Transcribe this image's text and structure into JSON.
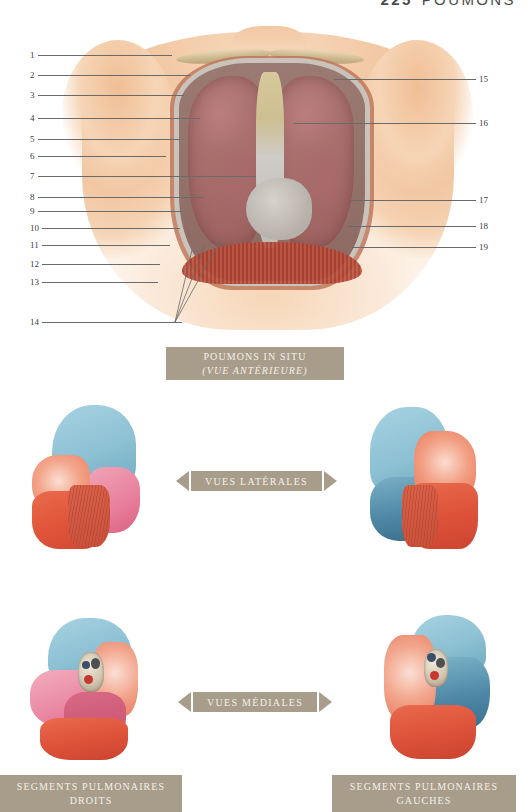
{
  "page": {
    "folio": "225",
    "running_head": "POUMONS",
    "background_color": "#ffffff",
    "plaque_color": "#a89d8a",
    "plaque_text_color": "#f4f0e8",
    "leader_color": "#6a6a6a"
  },
  "figure_anterior": {
    "caption_line1": "POUMONS IN SITU",
    "caption_line2": "(VUE ANTÉRIEURE)",
    "labels_left": [
      "1",
      "2",
      "3",
      "4",
      "5",
      "6",
      "7",
      "8",
      "9",
      "10",
      "11",
      "12",
      "13",
      "14"
    ],
    "labels_right": [
      "15",
      "16",
      "17",
      "18",
      "19"
    ]
  },
  "banner_lateral": {
    "text": "VUES LATÉRALES"
  },
  "banner_medial": {
    "text": "VUES MÉDIALES"
  },
  "figure_lateral_right_lung": {
    "labels_left": [
      "1",
      "2",
      "3",
      "6",
      "8",
      "9",
      "10"
    ],
    "labels_right": [
      "4",
      "5"
    ]
  },
  "figure_lateral_left_lung": {
    "labels_left": [
      "1",
      "2",
      "3",
      "4",
      "5"
    ],
    "labels_right": [
      "6",
      "8",
      "9",
      "10"
    ]
  },
  "figure_medial_right_lung": {
    "labels_left": [
      "1",
      "2",
      "3",
      "5",
      "6",
      "7",
      "8",
      "9"
    ],
    "labels_right": [
      "11",
      "10"
    ]
  },
  "figure_medial_left_lung": {
    "labels_left": [
      "11",
      "6",
      "7",
      "10"
    ],
    "labels_right": [
      "1",
      "2",
      "3",
      "4",
      "5",
      "8",
      "9"
    ]
  },
  "caption_right_segments": {
    "line1": "SEGMENTS PULMONAIRES",
    "line2": "DROITS"
  },
  "caption_left_segments": {
    "line1": "SEGMENTS PULMONAIRES",
    "line2": "GAUCHES"
  },
  "palette": {
    "apex_blue": "#8cc0d3",
    "apex_blue_deep": "#5d93ad",
    "middle_pink": "#e895a8",
    "middle_rose": "#d8607e",
    "lower_red": "#e8624a",
    "lower_red_deep": "#d14a32",
    "salmon": "#ef9279",
    "skin": "#f5d2b2",
    "lung_tissue": "#a96f6d"
  }
}
